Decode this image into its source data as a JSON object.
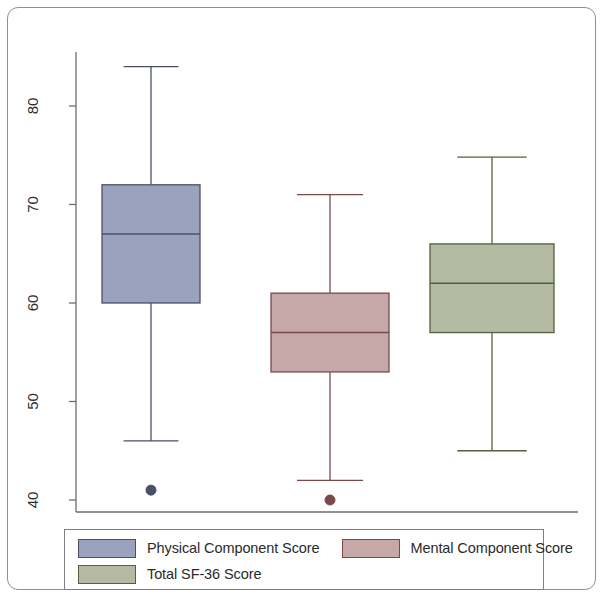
{
  "figure": {
    "type": "boxplot-figure",
    "background": "#ffffff",
    "border_color": "#8e9096"
  },
  "axis": {
    "tick_labels": [
      "80",
      "70",
      "60",
      "50",
      "40"
    ],
    "tick_values": [
      80,
      70,
      60,
      50,
      40
    ],
    "orientation": "vertical-rotated-labels",
    "axis_color": "#6b6d73"
  },
  "legend": {
    "rows": [
      [
        {
          "label": "Physical Component Score",
          "color": "#9aa2bd",
          "edge": "#4a5068"
        },
        {
          "label": "Mental Component Score",
          "color": "#c6a8a8",
          "edge": "#7a4a4a"
        }
      ],
      [
        {
          "label": "Total SF-36 Score",
          "color": "#b4bba2",
          "edge": "#56603c"
        }
      ]
    ]
  },
  "chart_data": {
    "type": "box",
    "title": "",
    "xlabel": "",
    "ylabel": "",
    "ylim": [
      38,
      86
    ],
    "yticks": [
      40,
      50,
      60,
      70,
      80
    ],
    "grid": false,
    "legend_position": "below",
    "categories": [
      "Physical Component Score",
      "Mental Component Score",
      "Total SF-36 Score"
    ],
    "series": [
      {
        "name": "Physical Component Score",
        "color": "#9aa2bd",
        "edge_color": "#4a5068",
        "whisker_low": 46,
        "q1": 60,
        "median": 67,
        "q3": 72,
        "whisker_high": 84,
        "outliers": [
          41
        ]
      },
      {
        "name": "Mental Component Score",
        "color": "#c6a8a8",
        "edge_color": "#7a4a4a",
        "whisker_low": 42,
        "q1": 53,
        "median": 57,
        "q3": 61,
        "whisker_high": 71,
        "outliers": [
          40
        ]
      },
      {
        "name": "Total SF-36 Score",
        "color": "#b4bba2",
        "edge_color": "#56603c",
        "whisker_low": 45,
        "q1": 57,
        "median": 62,
        "q3": 66,
        "whisker_high": 74.8,
        "outliers": []
      }
    ]
  }
}
